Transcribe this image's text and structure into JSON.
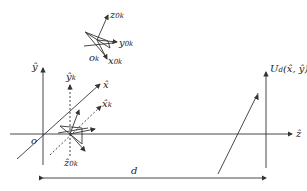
{
  "diagram": {
    "title": "",
    "colors": {
      "line": "#333333",
      "background": "#ffffff"
    },
    "global_frame": {
      "origin_label": "o",
      "y_axis_label": "ŷ",
      "x_axis_label": "x̂",
      "z_axis_label": "ẑ"
    },
    "object_frame": {
      "origin_label": "o",
      "origin_sub": "k",
      "x_label": "x",
      "x_sub": "0k",
      "y_label": "y",
      "y_sub": "0k",
      "z_label": "z",
      "z_sub": "0k"
    },
    "local_frame": {
      "y_label": "ŷ",
      "y_sub": "k",
      "x_label": "x̂",
      "x_sub": "k",
      "z_label": "ẑ",
      "z_sub": "0k"
    },
    "plane": {
      "label": "U",
      "label_sub": "d",
      "label_args": "(x̂, ŷ)"
    },
    "distance": {
      "label": "d"
    }
  }
}
